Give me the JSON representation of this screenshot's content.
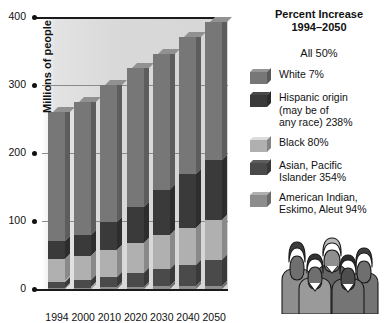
{
  "chart_data": {
    "type": "bar",
    "subtype": "stacked-3d-column",
    "title": "",
    "xlabel": "",
    "ylabel": "Millions of people",
    "ylim": [
      0,
      400
    ],
    "yticks": [
      0,
      100,
      200,
      300,
      400
    ],
    "ytick_labels": [
      "0",
      "100",
      "200",
      "300",
      "400"
    ],
    "grid": true,
    "legend_position": "right",
    "categories": [
      "1994",
      "2000",
      "2010",
      "2020",
      "2030",
      "2040",
      "2050"
    ],
    "totals": [
      260,
      275,
      300,
      325,
      346,
      370,
      393
    ],
    "series": [
      {
        "name": "American Indian, Eskimo, Aleut",
        "color": "#8d8d8d",
        "values": [
          2,
          2,
          3,
          3,
          4,
          4,
          4
        ]
      },
      {
        "name": "Asian, Pacific Islander",
        "color": "#4a4a4a",
        "values": [
          9,
          11,
          15,
          20,
          25,
          31,
          38
        ]
      },
      {
        "name": "Black",
        "color": "#b0b0b0",
        "values": [
          33,
          35,
          40,
          45,
          50,
          55,
          60
        ]
      },
      {
        "name": "Hispanic origin (may be of any race)",
        "color": "#3a3a3a",
        "values": [
          26,
          31,
          41,
          53,
          66,
          79,
          88
        ]
      },
      {
        "name": "White",
        "color": "#777777",
        "values": [
          190,
          196,
          201,
          204,
          201,
          201,
          203
        ]
      }
    ]
  },
  "legend": {
    "title_line1": "Percent Increase",
    "title_line2": "1994–2050",
    "all_label": "All  50%",
    "items": [
      {
        "label": "White  7%",
        "swatch": "#777777"
      },
      {
        "label": "Hispanic origin\n(may be of\nany race)  238%",
        "swatch": "#3a3a3a"
      },
      {
        "label": "Black  80%",
        "swatch": "#b0b0b0"
      },
      {
        "label": "Asian, Pacific\nIslander  354%",
        "swatch": "#4a4a4a"
      },
      {
        "label": "American Indian,\nEskimo, Aleut 94%",
        "swatch": "#8d8d8d"
      }
    ]
  },
  "illustration": {
    "name": "group-of-people-illustration",
    "people_count": 5
  }
}
